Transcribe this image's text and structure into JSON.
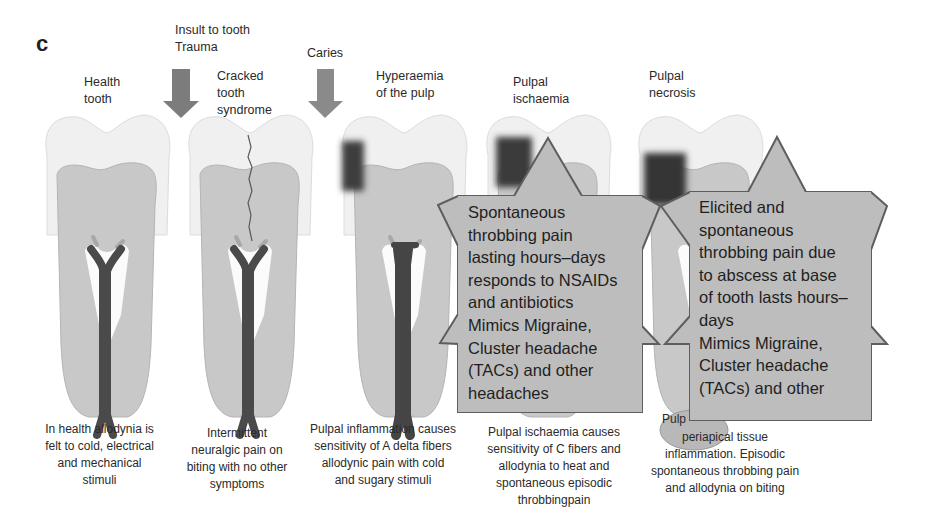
{
  "panel_letter": "c",
  "insult_label": "Insult to tooth\nTrauma",
  "caries_label": "Caries",
  "stages": [
    {
      "title": "Health\ntooth",
      "caption": "In health allodynia is\nfelt to cold, electrical\nand mechanical\nstimuli"
    },
    {
      "title": "Cracked\ntooth\nsyndrome",
      "caption": "Intermittent\nneuralgic pain on\nbiting with no other\nsymptoms"
    },
    {
      "title": "Hyperaemia\nof the pulp",
      "caption": "Pulpal inflammation causes\nsensitivity of A delta fibers\nallodynic pain with cold\nand sugary stimuli"
    },
    {
      "title": "Pulpal\nischaemia",
      "caption": "Pulpal ischaemia causes\nsensitivity of C fibers and\nallodynia to heat and\nspontaneous episodic\nthrobbingpain"
    },
    {
      "title": "Pulpal\nnecrosis",
      "caption": "periapical tissue\ninflammation. Episodic\nspontaneous throbbing pain\nand allodynia on biting",
      "caption_prefix": "Pulp"
    }
  ],
  "callouts": [
    {
      "text": "Spontaneous\nthrobbing pain\nlasting hours–days\nresponds to NSAIDs\nand antibiotics\nMimics Migraine,\nCluster headache\n(TACs) and other\nheadaches"
    },
    {
      "text": "Elicited and\nspontaneous\nthrobbing pain due\nto abscess at base\nof tooth lasts hours–\ndays\nMimics Migraine,\nCluster headache\n(TACs) and other"
    }
  ],
  "colors": {
    "enamel": "#efefef",
    "dentin": "#c9c9c9",
    "pulp_nerve": "#4a4a4a",
    "caries": "#3c3c3c",
    "arrow": "#7c7c7c",
    "callout_fill": "#bdbdbd",
    "callout_stroke": "#5e5e5e"
  }
}
